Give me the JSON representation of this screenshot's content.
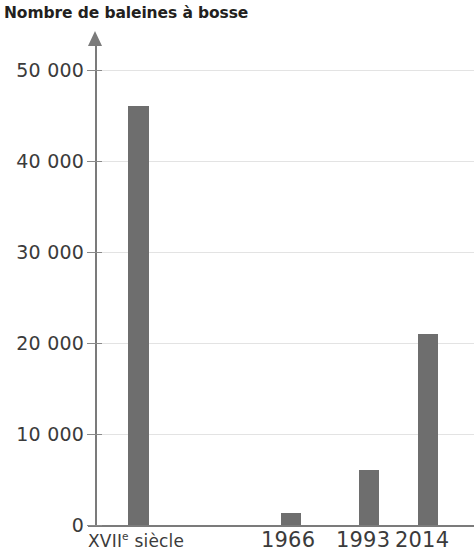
{
  "chart_data": {
    "type": "bar",
    "title": "Nombre de baleines à bosse",
    "xlabel": "",
    "ylabel": "",
    "categories": [
      "XVIIe siècle",
      "1966",
      "1993",
      "2014"
    ],
    "values": [
      46000,
      1300,
      6000,
      21000
    ],
    "ylim": [
      0,
      50000
    ],
    "yticks": [
      0,
      10000,
      20000,
      30000,
      40000,
      50000
    ],
    "ytick_labels": [
      "0",
      "10 000",
      "20 000",
      "30 000",
      "40 000",
      "50 000"
    ],
    "grid": true,
    "legend": "none",
    "bar_color": "#6e6e6e",
    "axis_color": "#7b7b7b",
    "grid_color": "#e3e3e3",
    "background": "#ffffff",
    "series": [
      {
        "name": "Nombre de baleines à bosse",
        "values": [
          46000,
          1300,
          6000,
          21000
        ]
      }
    ],
    "bars": [
      {
        "label_main": "XVII",
        "label_sup": "e",
        "label_tail": " siècle",
        "label": "XVIIe siècle",
        "value": 46000
      },
      {
        "label_main": "1966",
        "label_sup": "",
        "label_tail": "",
        "label": "1966",
        "value": 1300
      },
      {
        "label_main": "1993",
        "label_sup": "",
        "label_tail": "",
        "label": "1993",
        "value": 6000
      },
      {
        "label_main": "2014",
        "label_sup": "",
        "label_tail": "",
        "label": "2014",
        "value": 21000
      }
    ]
  }
}
